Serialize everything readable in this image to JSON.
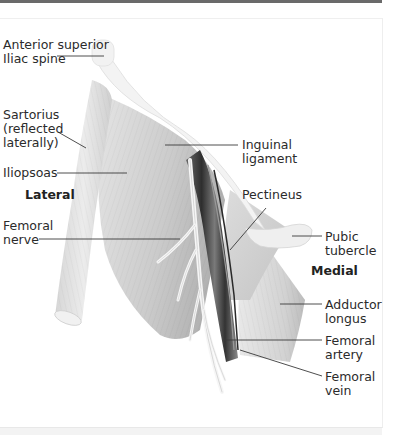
{
  "figure": {
    "orientation": {
      "lateral": "Lateral",
      "medial": "Medial"
    },
    "labels": [
      {
        "id": "asis",
        "text": "Anterior superior\nIliac spine",
        "side": "left"
      },
      {
        "id": "sartorius",
        "text": "Sartorius\n(reflected\nlaterally)",
        "side": "left"
      },
      {
        "id": "iliopsoas",
        "text": "Iliopsoas",
        "side": "left"
      },
      {
        "id": "femoral-nerve",
        "text": "Femoral\nnerve",
        "side": "left"
      },
      {
        "id": "inguinal-ligament",
        "text": "Inguinal\nligament",
        "side": "right"
      },
      {
        "id": "pectineus",
        "text": "Pectineus",
        "side": "right"
      },
      {
        "id": "pubic-tubercle",
        "text": "Pubic\ntubercle",
        "side": "right"
      },
      {
        "id": "adductor-longus",
        "text": "Adductor\nlongus",
        "side": "right"
      },
      {
        "id": "femoral-artery",
        "text": "Femoral\nartery",
        "side": "right"
      },
      {
        "id": "femoral-vein",
        "text": "Femoral\nvein",
        "side": "right"
      }
    ]
  },
  "colors": {
    "text": "#2b2b2b",
    "leader": "#3a3a3a",
    "muscle_light": "#e2e2e2",
    "muscle_mid": "#c9c9c9",
    "muscle_dark": "#a9a9a9",
    "vessel_dark": "#3c3c3c",
    "nerve": "#f4f4f4",
    "bone": "#eeeeee"
  }
}
